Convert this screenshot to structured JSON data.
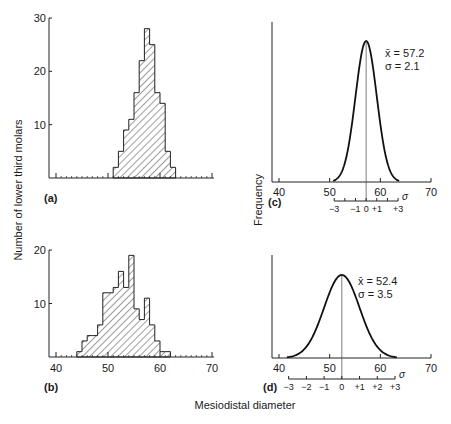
{
  "figure": {
    "y_label_left": "Number of lower third molars",
    "y_label_right": "Frequency",
    "x_label": "Mesiodistal diameter"
  },
  "chart_data": [
    {
      "panel": "(a)",
      "type": "bar",
      "title": "",
      "xlabel": "Mesiodistal diameter",
      "ylabel": "Number of lower third molars",
      "xlim": [
        40,
        70
      ],
      "ylim": [
        0,
        30
      ],
      "yticks": [
        "10",
        "20",
        "30"
      ],
      "bin_width": 1,
      "categories": [
        51,
        52,
        53,
        54,
        55,
        56,
        57,
        58,
        59,
        60,
        61,
        62
      ],
      "values": [
        2,
        5,
        9,
        11,
        16,
        22,
        28,
        25,
        16,
        14,
        5,
        2
      ],
      "hatched": true
    },
    {
      "panel": "(b)",
      "type": "bar",
      "title": "",
      "xlabel": "Mesiodistal diameter",
      "ylabel": "Number of lower third molars",
      "xlim": [
        40,
        70
      ],
      "ylim": [
        0,
        20
      ],
      "xticks": [
        "40",
        "50",
        "60",
        "70"
      ],
      "yticks": [
        "10",
        "20"
      ],
      "bin_width": 1,
      "categories": [
        44,
        45,
        46,
        47,
        48,
        49,
        50,
        51,
        52,
        53,
        54,
        55,
        56,
        57,
        58,
        59,
        60,
        61
      ],
      "values": [
        1,
        3,
        4,
        4,
        6,
        12,
        12,
        13,
        16,
        13,
        19,
        9,
        7,
        11,
        6,
        3,
        1,
        1
      ],
      "hatched": true
    },
    {
      "panel": "(c)",
      "type": "line",
      "title": "",
      "xlabel": "Mesiodistal diameter",
      "ylabel": "Frequency",
      "xlim": [
        40,
        70
      ],
      "xticks": [
        "40",
        "50",
        "60",
        "70"
      ],
      "distribution": "normal",
      "mean": 57.2,
      "sd": 2.1,
      "annotation_mean": "x̄ = 57.2",
      "annotation_sd": "σ = 2.1",
      "sigma_axis_labels": [
        "−3",
        "−1",
        "0",
        "+1",
        "+3"
      ],
      "sigma_symbol": "σ"
    },
    {
      "panel": "(d)",
      "type": "line",
      "title": "",
      "xlabel": "Mesiodistal diameter",
      "ylabel": "Frequency",
      "xlim": [
        40,
        70
      ],
      "xticks": [
        "40",
        "50",
        "60",
        "70"
      ],
      "distribution": "normal",
      "mean": 52.4,
      "sd": 3.5,
      "annotation_mean": "x̄ = 52.4",
      "annotation_sd": "σ = 3.5",
      "sigma_axis_labels": [
        "−3",
        "−2",
        "−1",
        "0",
        "+1",
        "+2",
        "+3"
      ],
      "sigma_symbol": "σ"
    }
  ]
}
